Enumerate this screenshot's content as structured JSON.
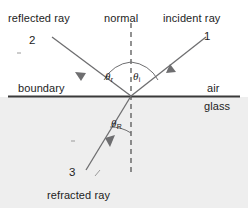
{
  "figure": {
    "labels": {
      "reflected_ray": "reflected ray",
      "normal": "normal",
      "incident_ray": "incident ray",
      "boundary": "boundary",
      "air": "air",
      "glass": "glass",
      "refracted_ray": "refracted ray"
    },
    "ray_numbers": {
      "incident": "1",
      "reflected": "2",
      "refracted": "3"
    },
    "angles": {
      "reflection": {
        "symbol": "θ",
        "subscript": "r"
      },
      "incidence": {
        "symbol": "θ",
        "subscript": "i"
      },
      "refraction": {
        "symbol": "θ",
        "subscript": "R"
      }
    },
    "colors": {
      "ink": "#1d1d1d",
      "ray": "#6e6e70",
      "boundary": "#3a3a3a",
      "glass_fill": "#ebebeb",
      "background": "#ffffff"
    }
  }
}
